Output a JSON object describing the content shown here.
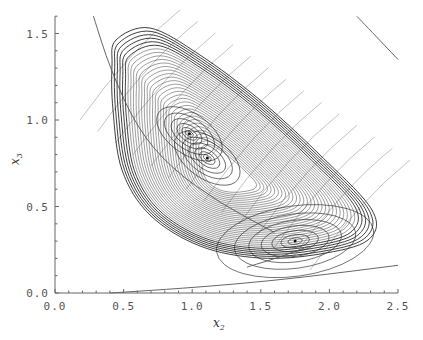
{
  "chart_data": {
    "type": "line",
    "title": "",
    "xlabel": "x2",
    "ylabel": "x3",
    "xlim": [
      0.0,
      2.5
    ],
    "ylim": [
      0.0,
      1.6
    ],
    "grid": false,
    "legend": null,
    "x_ticks": [
      "0.0",
      "0.5",
      "1.0",
      "1.5",
      "2.0",
      "2.5"
    ],
    "y_ticks": [
      "0.0",
      "0.5",
      "1.0",
      "1.5"
    ],
    "fixed_points": [
      {
        "x": 0.98,
        "y": 0.92
      },
      {
        "x": 1.11,
        "y": 0.78
      },
      {
        "x": 1.75,
        "y": 0.3
      }
    ],
    "outer_orbit": {
      "left_x": 0.42,
      "right_x": 2.3,
      "top_y": 1.52,
      "bottom_y": 0.2
    },
    "nullcline_curves": [
      {
        "name": "upper-left decaying curve",
        "points": [
          [
            0.28,
            1.6
          ],
          [
            0.4,
            1.3
          ],
          [
            0.6,
            0.95
          ],
          [
            0.85,
            0.72
          ],
          [
            1.2,
            0.52
          ],
          [
            1.6,
            0.35
          ]
        ]
      },
      {
        "name": "lower rising curve",
        "points": [
          [
            0.4,
            0.0
          ],
          [
            0.8,
            0.02
          ],
          [
            1.3,
            0.05
          ],
          [
            1.8,
            0.09
          ],
          [
            2.5,
            0.16
          ]
        ]
      },
      {
        "name": "upper-right line",
        "points": [
          [
            2.2,
            1.6
          ],
          [
            2.5,
            1.35
          ]
        ]
      },
      {
        "name": "short line below orbit",
        "points": [
          [
            1.4,
            0.15
          ],
          [
            1.65,
            0.21
          ],
          [
            1.85,
            0.27
          ]
        ]
      }
    ]
  },
  "axes": {
    "x_title": "x",
    "x_sub": "2",
    "y_title": "x",
    "y_sub": "3"
  }
}
